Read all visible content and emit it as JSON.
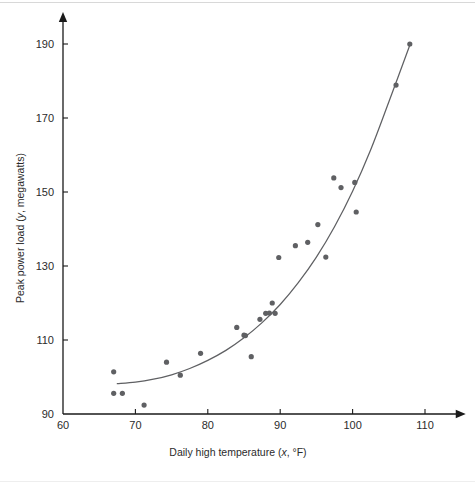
{
  "figure": {
    "background": "#ffffff",
    "axis_color": "#1a1a1a",
    "point_color": "#5f6063",
    "curve_color": "#5f6063"
  },
  "chart_data": {
    "type": "scatter",
    "title": "",
    "xlabel_parts": {
      "pre": "Daily high temperature (",
      "var": "x",
      "post": ", °F)"
    },
    "ylabel_parts": {
      "pre": "Peak power load (",
      "var": "y",
      "post": ", megawatts)"
    },
    "xlabel": "Daily high temperature (x, °F)",
    "ylabel": "Peak power load (y, megawatts)",
    "xlim": [
      60,
      113
    ],
    "ylim": [
      90,
      193
    ],
    "xticks": [
      60,
      70,
      80,
      90,
      100,
      110
    ],
    "yticks": [
      90,
      110,
      130,
      150,
      170,
      190
    ],
    "xtick_labels": [
      "60",
      "70",
      "80",
      "90",
      "100",
      "110"
    ],
    "ytick_labels": [
      "90",
      "110",
      "130",
      "150",
      "170",
      "190"
    ],
    "grid": false,
    "legend": null,
    "marker": {
      "shape": "circle",
      "radius": 2.6,
      "color": "#5f6063"
    },
    "points": [
      [
        67.0,
        101.4
      ],
      [
        67.0,
        95.6
      ],
      [
        68.2,
        95.6
      ],
      [
        71.2,
        92.4
      ],
      [
        74.3,
        104.0
      ],
      [
        76.2,
        100.5
      ],
      [
        79.0,
        106.4
      ],
      [
        84.0,
        113.4
      ],
      [
        85.0,
        111.3
      ],
      [
        85.2,
        111.2
      ],
      [
        86.0,
        105.5
      ],
      [
        87.2,
        115.6
      ],
      [
        88.0,
        117.2
      ],
      [
        88.5,
        117.3
      ],
      [
        89.3,
        117.2
      ],
      [
        88.9,
        120.0
      ],
      [
        89.8,
        132.3
      ],
      [
        92.1,
        135.5
      ],
      [
        93.8,
        136.4
      ],
      [
        95.2,
        141.2
      ],
      [
        96.3,
        132.4
      ],
      [
        97.4,
        153.8
      ],
      [
        98.4,
        151.2
      ],
      [
        100.3,
        152.6
      ],
      [
        100.5,
        144.6
      ],
      [
        106.0,
        178.9
      ],
      [
        107.9,
        190.0
      ]
    ],
    "fit_curve": {
      "label": "",
      "description": "exponential-style fitted regression curve",
      "x": [
        67.5,
        70,
        72.5,
        75,
        77.5,
        80,
        82.5,
        85,
        87.5,
        90,
        92.5,
        95,
        97.5,
        100,
        102.5,
        105,
        108
      ],
      "y": [
        98.2,
        98.6,
        99.4,
        100.6,
        102.3,
        104.5,
        107.2,
        110.6,
        114.7,
        119.6,
        125.5,
        132.4,
        140.6,
        150.2,
        161.4,
        174.3,
        190.2
      ]
    }
  }
}
